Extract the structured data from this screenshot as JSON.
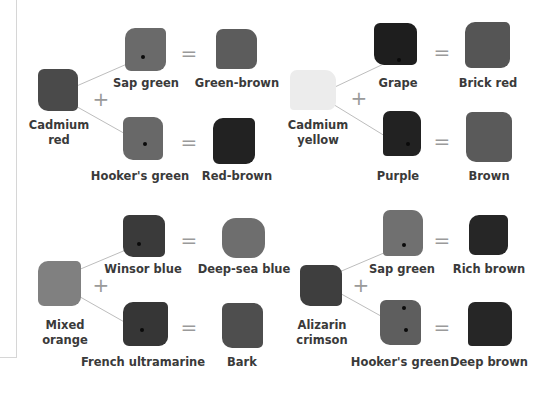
{
  "panels": [
    {
      "base": {
        "label_line1": "Cadmium",
        "label_line2": "red",
        "tone": "#4a4a4a"
      },
      "plus": "+",
      "mixes": [
        {
          "with": "Sap green",
          "with_tone": "#6a6a6a",
          "equals": "=",
          "result": "Green-brown",
          "result_tone": "#5c5c5c"
        },
        {
          "with": "Hooker's green",
          "with_tone": "#686868",
          "equals": "=",
          "result": "Red-brown",
          "result_tone": "#222222"
        }
      ]
    },
    {
      "base": {
        "label_line1": "Cadmium",
        "label_line2": "yellow",
        "tone": "#ececec"
      },
      "plus": "+",
      "mixes": [
        {
          "with": "Grape",
          "with_tone": "#1e1e1e",
          "equals": "=",
          "result": "Brick red",
          "result_tone": "#555555"
        },
        {
          "with": "Purple",
          "with_tone": "#222222",
          "equals": "=",
          "result": "Brown",
          "result_tone": "#5a5a5a"
        }
      ]
    },
    {
      "base": {
        "label_line1": "Mixed",
        "label_line2": "orange",
        "tone": "#808080"
      },
      "plus": "+",
      "mixes": [
        {
          "with": "Winsor blue",
          "with_tone": "#3a3a3a",
          "equals": "=",
          "result": "Deep-sea blue",
          "result_tone": "#6e6e6e"
        },
        {
          "with": "French ultramarine",
          "with_tone": "#363636",
          "equals": "=",
          "result": "Bark",
          "result_tone": "#4e4e4e"
        }
      ]
    },
    {
      "base": {
        "label_line1": "Alizarin",
        "label_line2": "crimson",
        "tone": "#3e3e3e"
      },
      "plus": "+",
      "mixes": [
        {
          "with": "Sap green",
          "with_tone": "#707070",
          "equals": "=",
          "result": "Rich brown",
          "result_tone": "#262626"
        },
        {
          "with": "Hooker's green",
          "with_tone": "#5e5e5e",
          "equals": "=",
          "result": "Deep brown",
          "result_tone": "#262626"
        }
      ]
    }
  ]
}
